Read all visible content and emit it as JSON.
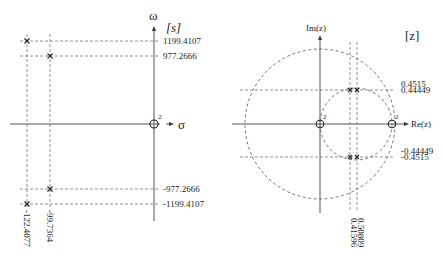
{
  "s_plane": {
    "plane_label": "[s]",
    "sigma_axis_label": "σ",
    "omega_axis_label": "ω",
    "poles": [
      {
        "re": -122.4077,
        "im": 1199.4107
      },
      {
        "re": -99.7364,
        "im": 977.2666
      },
      {
        "re": -99.7364,
        "im": -977.2666
      },
      {
        "re": -122.4077,
        "im": -1199.4107
      }
    ],
    "imag_labels": [
      "1199.4107",
      "977.2666",
      "-977.2666",
      "-1199.4107"
    ],
    "real_labels": [
      "-122.4077",
      "-99.7364"
    ],
    "zero_multiplicity": "2"
  },
  "z_plane": {
    "plane_label": "[z]",
    "re_axis_label": "Re(z)",
    "im_axis_label": "Im(z)",
    "poles": [
      {
        "re": 0.41596,
        "im": 0.4515
      },
      {
        "re": 0.50809,
        "im": 0.44449
      },
      {
        "re": 0.41596,
        "im": -0.4515
      },
      {
        "re": 0.50809,
        "im": -0.44449
      }
    ],
    "imag_labels_upper": [
      "0.4515",
      "0.44449"
    ],
    "imag_labels_lower": [
      "-0.44449",
      "-0.4515"
    ],
    "real_labels": [
      "0.50809",
      "0.41596"
    ],
    "zero_origin_multiplicity": "2",
    "zero_one_multiplicity": "2"
  }
}
